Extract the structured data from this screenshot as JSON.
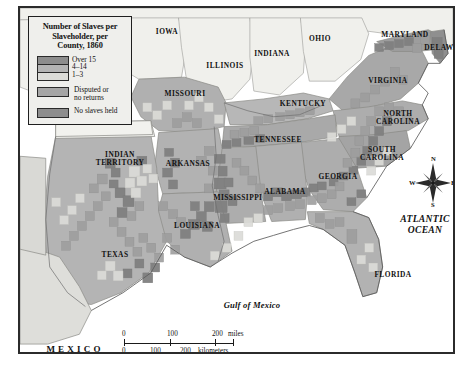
{
  "legend": {
    "title": "Number of Slaves per Slaveholder, per County, 1860",
    "title_lines": [
      "Number of Slaves per",
      "Slaveholder, per",
      "County, 1860"
    ],
    "graduated": [
      {
        "label": "Over 15",
        "color": "#8d8d8d"
      },
      {
        "label": "4–14",
        "color": "#b4b4b4"
      },
      {
        "label": "1–3",
        "color": "#dcdcd8"
      }
    ],
    "other": [
      {
        "label_lines": [
          "Disputed or",
          "no returns"
        ],
        "label": "Disputed or no returns",
        "color": "#a6a6a6"
      },
      {
        "label_lines": [
          "No slaves held"
        ],
        "label": "No slaves held",
        "color": "#8d8d8d"
      }
    ]
  },
  "states": [
    {
      "name": "IOWA",
      "lines": [
        "IOWA"
      ],
      "x": 147,
      "y": 20
    },
    {
      "name": "ILLINOIS",
      "lines": [
        "ILLINOIS"
      ],
      "x": 205,
      "y": 54
    },
    {
      "name": "INDIANA",
      "lines": [
        "INDIANA"
      ],
      "x": 252,
      "y": 42
    },
    {
      "name": "OHIO",
      "lines": [
        "OHIO"
      ],
      "x": 300,
      "y": 27
    },
    {
      "name": "MARYLAND",
      "lines": [
        "MARYLAND"
      ],
      "x": 385,
      "y": 23
    },
    {
      "name": "DELAWARE",
      "lines": [
        "DELAWARE"
      ],
      "x": 427,
      "y": 36
    },
    {
      "name": "VIRGINIA",
      "lines": [
        "VIRGINIA"
      ],
      "x": 368,
      "y": 69
    },
    {
      "name": "MISSOURI",
      "lines": [
        "MISSOURI"
      ],
      "x": 165,
      "y": 82
    },
    {
      "name": "KENTUCKY",
      "lines": [
        "KENTUCKY"
      ],
      "x": 283,
      "y": 92
    },
    {
      "name": "NORTH CAROLINA",
      "lines": [
        "NORTH",
        "CAROLINA"
      ],
      "x": 378,
      "y": 107
    },
    {
      "name": "TENNESSEE",
      "lines": [
        "TENNESSEE"
      ],
      "x": 258,
      "y": 128
    },
    {
      "name": "SOUTH CAROLINA",
      "lines": [
        "SOUTH",
        "CAROLINA"
      ],
      "x": 362,
      "y": 143
    },
    {
      "name": "INDIAN TERRITORY",
      "lines": [
        "INDIAN",
        "TERRITORY"
      ],
      "x": 100,
      "y": 148
    },
    {
      "name": "ARKANSAS",
      "lines": [
        "ARKANSAS"
      ],
      "x": 168,
      "y": 152
    },
    {
      "name": "GEORGIA",
      "lines": [
        "GEORGIA"
      ],
      "x": 318,
      "y": 165
    },
    {
      "name": "ALABAMA",
      "lines": [
        "ALABAMA"
      ],
      "x": 265,
      "y": 180
    },
    {
      "name": "MISSISSIPPI",
      "lines": [
        "MISSISSIPPI"
      ],
      "x": 218,
      "y": 186
    },
    {
      "name": "LOUISIANA",
      "lines": [
        "LOUISIANA"
      ],
      "x": 177,
      "y": 214
    },
    {
      "name": "TEXAS",
      "lines": [
        "TEXAS"
      ],
      "x": 95,
      "y": 243
    },
    {
      "name": "FLORIDA",
      "lines": [
        "FLORIDA"
      ],
      "x": 373,
      "y": 263
    }
  ],
  "water_labels": [
    {
      "name": "ATLANTIC OCEAN",
      "lines": [
        "ATLANTIC",
        "OCEAN"
      ],
      "x": 405,
      "y": 212
    },
    {
      "name": "Gulf of Mexico",
      "lines": [
        "Gulf of Mexico"
      ],
      "x": 232,
      "y": 296
    }
  ],
  "country_labels": [
    {
      "name": "MEXICO",
      "text": "MEXICO",
      "x": 55,
      "y": 340
    }
  ],
  "scale": {
    "miles": {
      "ticks": [
        "0",
        "100",
        "200"
      ],
      "unit": "miles"
    },
    "kilometers": {
      "ticks": [
        "0",
        "100",
        "200"
      ],
      "unit": "kilometers"
    }
  },
  "compass": {
    "north": "N",
    "east": "E",
    "south": "S",
    "west": "W"
  },
  "colors": {
    "over15": "#8d8d8d",
    "mid4to14": "#b4b4b4",
    "low1to3": "#dcdcd8",
    "disputed": "#a6a6a6",
    "noslaves": "#8d8d8d",
    "free_state": "#f0f0ec",
    "ocean": "#ffffff",
    "border": "#2b2b2b",
    "page": "#ffffff"
  }
}
